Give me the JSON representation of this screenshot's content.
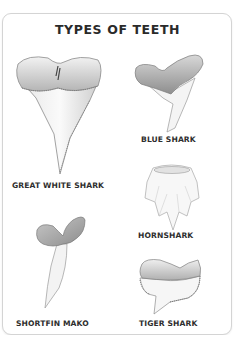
{
  "title": "TYPES OF TEETH",
  "teeth": [
    {
      "name": "GREAT WHITE SHARK",
      "icon": "great-white-tooth"
    },
    {
      "name": "BLUE SHARK",
      "icon": "blue-shark-tooth"
    },
    {
      "name": "HORNSHARK",
      "icon": "hornshark-tooth"
    },
    {
      "name": "SHORTFIN MAKO",
      "icon": "shortfin-mako-tooth"
    },
    {
      "name": "TIGER SHARK",
      "icon": "tiger-shark-tooth"
    }
  ],
  "colors": {
    "border": "#d4d4d4",
    "text": "#2e2e2e",
    "tooth_shade": "#9a9a9a"
  }
}
